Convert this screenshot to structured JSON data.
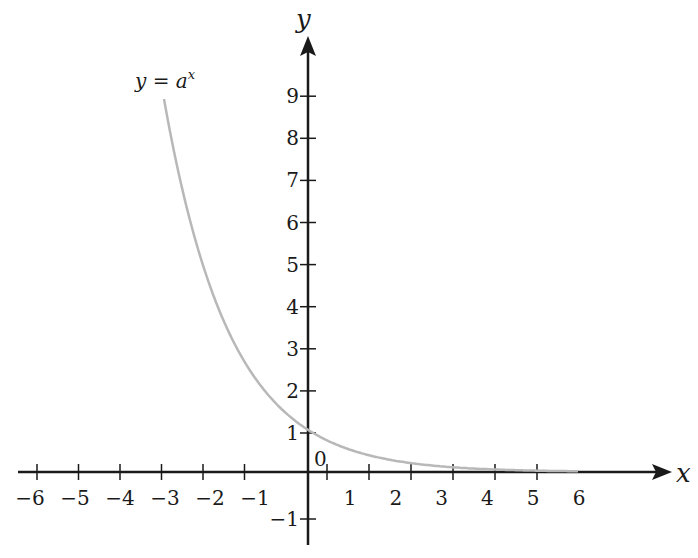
{
  "chart_data": {
    "type": "line",
    "title": "",
    "xlabel": "x",
    "ylabel": "y",
    "origin_label": "0",
    "xlim": [
      -6,
      6
    ],
    "ylim": [
      -1,
      9
    ],
    "x_ticks": [
      -6,
      -5,
      -4,
      -3,
      -2,
      -1,
      1,
      2,
      3,
      4,
      5,
      6
    ],
    "x_tick_labels": [
      "−6",
      "−5",
      "−4",
      "−3",
      "−2",
      "−1",
      "1",
      "2",
      "3",
      "4",
      "5",
      "6"
    ],
    "y_ticks": [
      -1,
      1,
      2,
      3,
      4,
      5,
      6,
      7,
      8,
      9
    ],
    "y_tick_labels": [
      "−1",
      "1",
      "2",
      "3",
      "4",
      "5",
      "6",
      "7",
      "8",
      "9"
    ],
    "grid": false,
    "series": [
      {
        "name": "y = a^x",
        "label_text": "y = a",
        "label_superscript": "x",
        "color": "#b8b8b8",
        "base_a": 0.48,
        "x": [
          -3,
          -2,
          -1,
          0,
          1,
          2,
          3,
          4,
          5,
          6
        ],
        "y": [
          9.0,
          4.33,
          2.08,
          1.0,
          0.48,
          0.23,
          0.11,
          0.05,
          0.03,
          0.01
        ]
      }
    ]
  },
  "colors": {
    "axis": "#1a1a1a",
    "curve": "#b8b8b8"
  }
}
